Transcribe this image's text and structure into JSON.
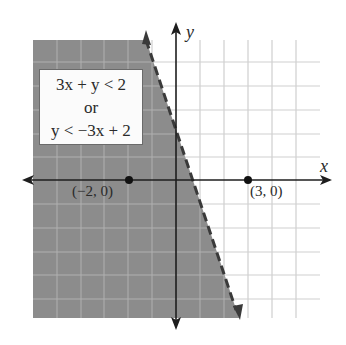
{
  "figure": {
    "type": "linear-inequality-graph",
    "equation_box": {
      "line1": "3x + y < 2",
      "line2": "or",
      "line3": "y < −3x + 2"
    },
    "axes": {
      "x_label": "x",
      "y_label": "y",
      "x_range": [
        -6,
        6
      ],
      "y_range": [
        -6,
        6
      ],
      "grid_unit": 1
    },
    "boundary_line": {
      "equation": "y = -3x + 2",
      "style": "dashed",
      "color": "#3a3a3a"
    },
    "shaded_region": {
      "side": "left/below boundary",
      "color": "#8c8c8c"
    },
    "points": [
      {
        "label": "(−2, 0)",
        "x": -2,
        "y": 0
      },
      {
        "label": "(3, 0)",
        "x": 3,
        "y": 0
      }
    ],
    "colors": {
      "shade": "#8c8c8c",
      "grid_light": "#c8c8c8",
      "grid_on_shade": "#b4b4b4",
      "axis": "#1e1e1e"
    }
  }
}
